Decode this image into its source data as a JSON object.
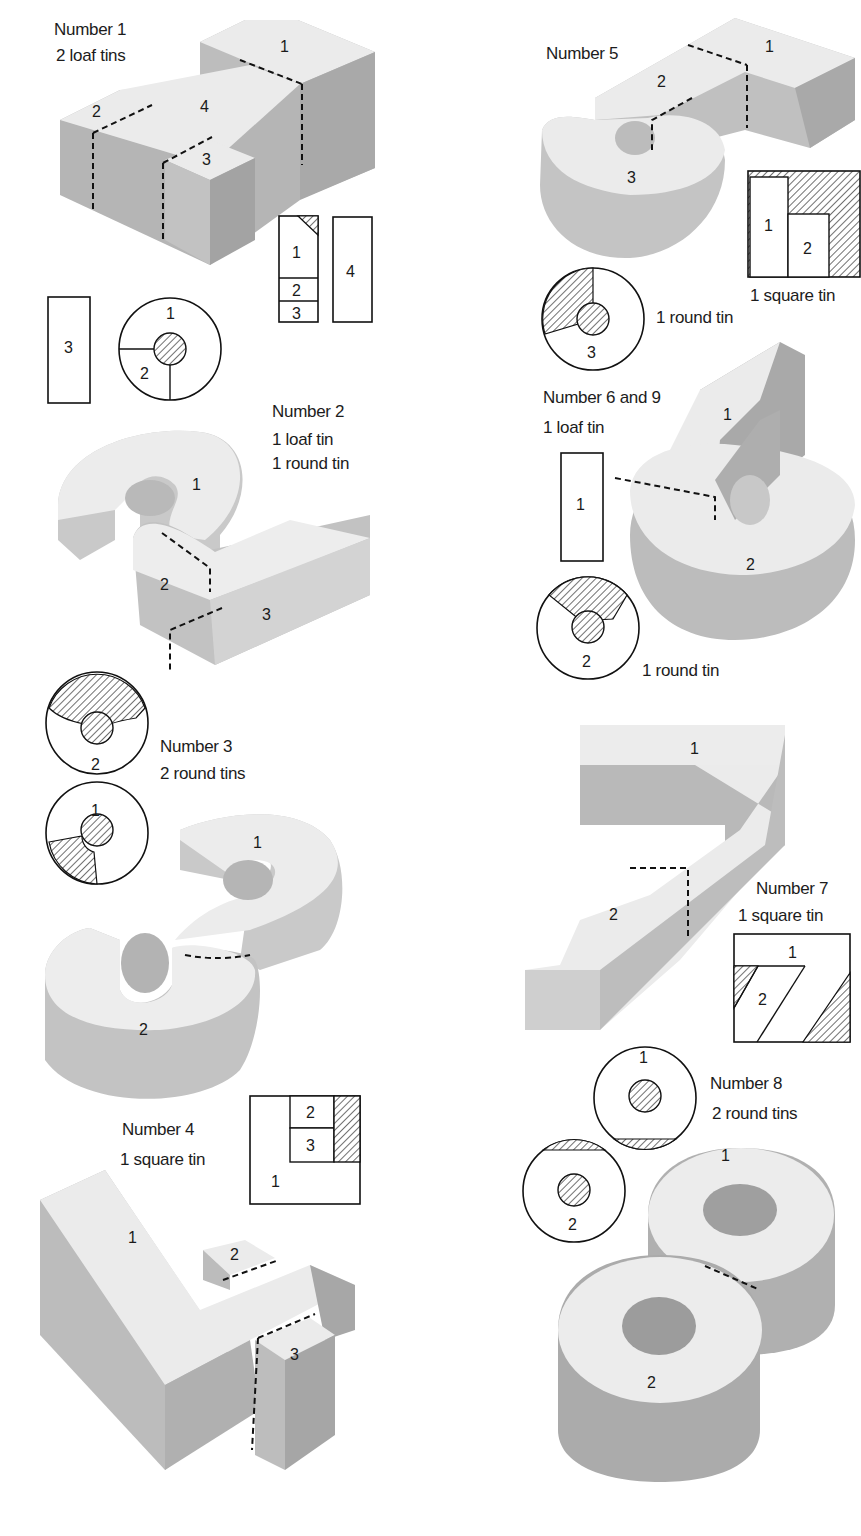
{
  "page": {
    "background": "#ffffff",
    "block_top": "#ebebeb",
    "block_side": "#b7b7b7",
    "block_side_dark": "#a6a6a6",
    "hatch": "#333333"
  },
  "figures": [
    {
      "id": "number-1",
      "title": "Number 1",
      "tins": [
        "2 loaf tins"
      ],
      "piece_labels": [
        "1",
        "2",
        "3",
        "4"
      ],
      "templates": {
        "loaf_tin_a": [
          "1",
          "2",
          "3"
        ],
        "loaf_tin_b": [
          "4"
        ],
        "loose_rect": [
          "3"
        ],
        "round_cut": [
          "1",
          "2"
        ]
      }
    },
    {
      "id": "number-2",
      "title": "Number 2",
      "tins": [
        "1 loaf tin",
        "1 round tin"
      ],
      "piece_labels": [
        "1",
        "2",
        "3"
      ],
      "templates": {
        "round_cut": [
          "2"
        ]
      }
    },
    {
      "id": "number-3",
      "title": "Number 3",
      "tins": [
        "2 round tins"
      ],
      "piece_labels": [
        "1",
        "2"
      ],
      "templates": {
        "round_cut_a": [
          "1"
        ]
      }
    },
    {
      "id": "number-4",
      "title": "Number 4",
      "tins": [
        "1 square tin"
      ],
      "piece_labels": [
        "1",
        "2",
        "3"
      ],
      "templates": {
        "square_cut": [
          "1",
          "2",
          "3"
        ]
      }
    },
    {
      "id": "number-5",
      "title": "Number 5",
      "tins": [
        "1 square tin",
        "1 round tin"
      ],
      "piece_labels": [
        "1",
        "2",
        "3"
      ],
      "templates": {
        "square_cut": [
          "1",
          "2"
        ],
        "round_cut": [
          "3"
        ]
      }
    },
    {
      "id": "number-6-9",
      "title": "Number 6 and 9",
      "tins": [
        "1 loaf tin",
        "1 round tin"
      ],
      "piece_labels": [
        "1",
        "2"
      ],
      "templates": {
        "loaf_rect": [
          "1"
        ],
        "round_cut": [
          "2"
        ]
      }
    },
    {
      "id": "number-7",
      "title": "Number 7",
      "tins": [
        "1 square tin"
      ],
      "piece_labels": [
        "1",
        "2"
      ],
      "templates": {
        "square_cut": [
          "1",
          "2"
        ]
      }
    },
    {
      "id": "number-8",
      "title": "Number 8",
      "tins": [
        "2 round tins"
      ],
      "piece_labels": [
        "1",
        "2"
      ],
      "templates": {
        "round_a": [
          "1"
        ],
        "round_b": [
          "2"
        ]
      }
    }
  ],
  "captions": {
    "n1_title": "Number 1",
    "n1_tins": "2 loaf tins",
    "n2_title": "Number 2",
    "n2_tin1": "1 loaf tin",
    "n2_tin2": "1 round tin",
    "n3_title": "Number 3",
    "n3_tins": "2 round tins",
    "n4_title": "Number 4",
    "n4_tins": "1 square tin",
    "n5_title": "Number 5",
    "n5_square": "1 square tin",
    "n5_round": "1 round tin",
    "n69_title": "Number 6 and 9",
    "n69_loaf": "1 loaf tin",
    "n69_round": "1 round tin",
    "n7_title": "Number 7",
    "n7_tins": "1 square tin",
    "n8_title": "Number 8",
    "n8_tins": "2 round tins"
  },
  "labels": {
    "one": "1",
    "two": "2",
    "three": "3",
    "four": "4"
  }
}
